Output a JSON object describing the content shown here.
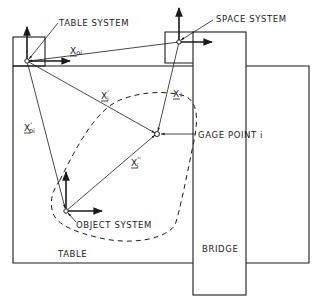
{
  "diagram": {
    "labels": {
      "table_system": "TABLE SYSTEM",
      "space_system": "SPACE SYSTEM",
      "gage_point": "GAGE POINT i",
      "object_system": "OBJECT SYSTEM",
      "table": "TABLE",
      "bridge": "BRIDGE"
    },
    "vectors": {
      "x_oi": {
        "base": "X",
        "sub": "oi",
        "sup": ""
      },
      "x_i": {
        "base": "X",
        "sub": "i",
        "sup": ""
      },
      "x_i_prime": {
        "base": "X",
        "sub": "i",
        "sup": "'"
      },
      "x_oi_prime": {
        "base": "X",
        "sub": "oi",
        "sup": "'"
      },
      "x_i_double_prime": {
        "base": "X",
        "sub": "i",
        "sup": "''"
      }
    },
    "colors": {
      "line": "#1a1a1a",
      "background": "#ffffff"
    }
  }
}
